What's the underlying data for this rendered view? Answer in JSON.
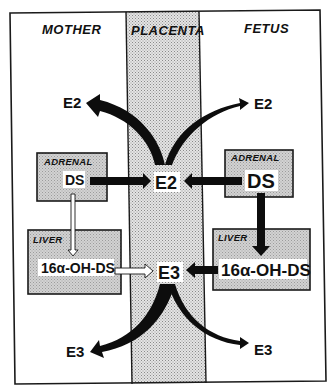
{
  "columns": {
    "mother": "MOTHER",
    "placenta": "PLACENTA",
    "fetus": "FETUS"
  },
  "mother": {
    "adrenal": {
      "label": "ADRENAL",
      "compound": "DS"
    },
    "liver": {
      "label": "LIVER",
      "compound": "16α-OH-DS"
    },
    "outputs": {
      "e2": "E2",
      "e3": "E3"
    }
  },
  "placenta": {
    "e2": "E2",
    "e3": "E3"
  },
  "fetus": {
    "adrenal": {
      "label": "ADRENAL",
      "compound": "DS"
    },
    "liver": {
      "label": "LIVER",
      "compound": "16α-OH-DS"
    },
    "outputs": {
      "e2": "E2",
      "e3": "E3"
    }
  },
  "colors": {
    "border": "#1a1a1a",
    "placenta_fill": "#d9d9d9",
    "organ_box_fill": "#cfcfcf",
    "arrow": "#0d0d0d",
    "background": "#ffffff"
  }
}
